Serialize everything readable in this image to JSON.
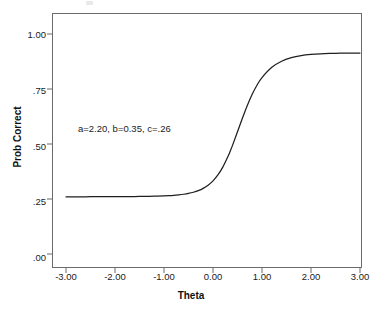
{
  "chart_data": {
    "type": "line",
    "title": "",
    "subtitle": "",
    "xlabel": "Theta",
    "ylabel": "Prob Correct",
    "xlim": [
      -3.3,
      3.3
    ],
    "ylim": [
      0.0,
      1.08
    ],
    "grid": false,
    "legend": null,
    "annotations": [
      {
        "text": "a=2.20, b=0.35, c=.26",
        "x": -1.5,
        "y": 0.58
      }
    ],
    "xticks": [
      -3,
      -2,
      -1,
      0,
      1,
      2,
      3
    ],
    "xtick_labels": [
      "-3.00",
      "-2.00",
      "-1.00",
      "0.00",
      "1.00",
      "2.00",
      "3.00"
    ],
    "yticks": [
      0.0,
      0.25,
      0.5,
      0.75,
      1.0
    ],
    "ytick_labels": [
      ".00",
      ".25",
      ".50",
      ".75",
      "1.00"
    ],
    "model": "3PL item characteristic curve",
    "parameters": {
      "a": 2.2,
      "b": 0.35,
      "c": 0.26,
      "D": 1.7
    },
    "series": [
      {
        "name": "Item Characteristic Curve",
        "color": "#1f1f1f",
        "x": [
          -3.0,
          -2.8,
          -2.6,
          -2.4,
          -2.2,
          -2.0,
          -1.8,
          -1.6,
          -1.4,
          -1.2,
          -1.0,
          -0.9,
          -0.8,
          -0.7,
          -0.6,
          -0.5,
          -0.4,
          -0.3,
          -0.2,
          -0.1,
          0.0,
          0.1,
          0.2,
          0.3,
          0.35,
          0.4,
          0.5,
          0.6,
          0.7,
          0.8,
          0.9,
          1.0,
          1.2,
          1.4,
          1.6,
          1.8,
          2.0,
          2.2,
          2.4,
          2.6,
          2.8,
          3.0
        ],
        "y": [
          0.2601,
          0.2601,
          0.2602,
          0.2603,
          0.2604,
          0.2606,
          0.2609,
          0.2613,
          0.262,
          0.263,
          0.2645,
          0.2655,
          0.2669,
          0.2689,
          0.2716,
          0.2754,
          0.2807,
          0.2881,
          0.2985,
          0.3128,
          0.3325,
          0.3593,
          0.3949,
          0.4405,
          0.4667,
          0.495,
          0.5553,
          0.6172,
          0.6754,
          0.7263,
          0.7684,
          0.8018,
          0.8484,
          0.8762,
          0.8923,
          0.9016,
          0.9069,
          0.91,
          0.9117,
          0.9127,
          0.9133,
          0.9136
        ]
      }
    ]
  },
  "figure": {
    "xlabel": "Theta",
    "ylabel": "Prob Correct",
    "annotation": "a=2.20, b=0.35, c=.26",
    "ytick_labels": [
      "1.00",
      ".75",
      ".50",
      ".25",
      ".00"
    ],
    "xtick_labels": [
      "-3.00",
      "-2.00",
      "-1.00",
      "0.00",
      "1.00",
      "2.00",
      "3.00"
    ],
    "curve_color": "#1f1f1f",
    "frame_color": "#6b6b6b"
  }
}
